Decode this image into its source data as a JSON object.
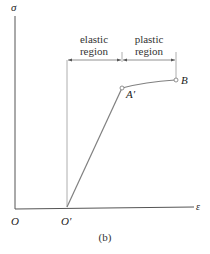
{
  "figure": {
    "caption": "(b)",
    "axes": {
      "y_label": "σ",
      "x_label": "ε",
      "origin_label": "O"
    },
    "points": {
      "o_prime": "O′",
      "a_prime": "A′",
      "b": "B"
    },
    "regions": {
      "elastic_line1": "elastic",
      "elastic_line2": "region",
      "plastic_line1": "plastic",
      "plastic_line2": "region"
    },
    "colors": {
      "axis": "#555555",
      "curve": "#808080",
      "text": "#222222"
    }
  }
}
